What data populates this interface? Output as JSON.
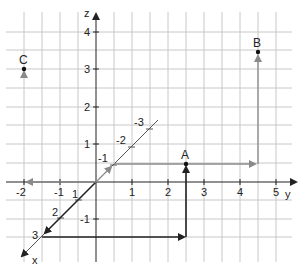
{
  "diagram": {
    "axes": {
      "x": {
        "label": "x",
        "ticks": [
          "-1",
          "-2",
          "-3",
          "1",
          "2",
          "3"
        ]
      },
      "y": {
        "label": "y",
        "ticks": [
          "-2",
          "-1",
          "1",
          "2",
          "3",
          "4",
          "5"
        ]
      },
      "z": {
        "label": "z",
        "ticks": [
          "4",
          "3",
          "2",
          "1",
          "-1"
        ]
      }
    },
    "points": [
      {
        "name": "A",
        "label": "A",
        "coords": [
          3,
          2.5,
          0.5
        ]
      },
      {
        "name": "B",
        "label": "B",
        "coords": [
          -1,
          4.5,
          3
        ]
      },
      {
        "name": "C",
        "label": "C",
        "coords": [
          0,
          -2,
          3
        ]
      }
    ],
    "colors": {
      "grid": "#c8c8c8",
      "axis": "#222222",
      "path_dark": "#222222",
      "path_gray": "#8a8a8a"
    }
  }
}
